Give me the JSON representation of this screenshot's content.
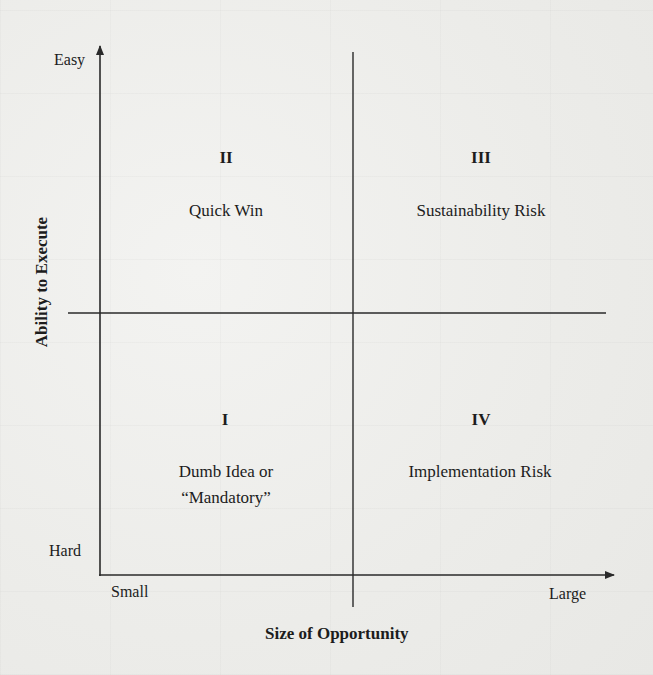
{
  "diagram": {
    "type": "2x2-matrix",
    "x_axis": {
      "title": "Size of Opportunity",
      "low_label": "Small",
      "high_label": "Large"
    },
    "y_axis": {
      "title": "Ability to Execute",
      "low_label": "Hard",
      "high_label": "Easy"
    },
    "quadrants": [
      {
        "id": "II",
        "position": "top-left",
        "label": "Quick Win"
      },
      {
        "id": "III",
        "position": "top-right",
        "label": "Sustainability Risk"
      },
      {
        "id": "I",
        "position": "bottom-left",
        "label_line1": "Dumb Idea or",
        "label_line2": "“Mandatory”"
      },
      {
        "id": "IV",
        "position": "bottom-right",
        "label": "Implementation Risk"
      }
    ],
    "colors": {
      "line": "#2a2a2a",
      "text": "#1c1c1c",
      "background": "#efefed"
    }
  }
}
